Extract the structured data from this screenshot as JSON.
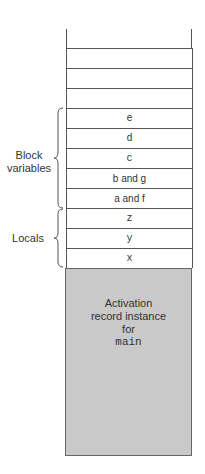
{
  "diagram": {
    "type": "stack-diagram",
    "empty_rows": 4,
    "cells": [
      {
        "label": "e"
      },
      {
        "label": "d"
      },
      {
        "label": "c"
      },
      {
        "label": "b and g"
      },
      {
        "label": "a and f"
      },
      {
        "label": "z"
      },
      {
        "label": "y"
      },
      {
        "label": "x"
      }
    ],
    "groups": [
      {
        "label_line1": "Block",
        "label_line2": "variables"
      },
      {
        "label": "Locals"
      }
    ],
    "activation_record": {
      "line1": "Activation",
      "line2": "record instance",
      "line3": "for",
      "line4": "main"
    },
    "colors": {
      "activation_fill": "#c9c9c9",
      "line": "#555555"
    }
  }
}
